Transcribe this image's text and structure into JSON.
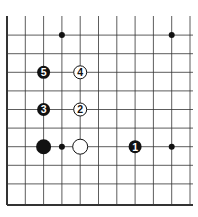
{
  "diagram": {
    "type": "go-board-fragment",
    "columns": 11,
    "rows": 10,
    "edges": [
      "left",
      "bottom"
    ],
    "colors": {
      "black": "#111111",
      "white": "#ffffff",
      "line": "#333333"
    },
    "star_points": [
      {
        "col": 3,
        "row": 1
      },
      {
        "col": 9,
        "row": 1
      },
      {
        "col": 9,
        "row": 7
      }
    ],
    "stones": [
      {
        "color": "black",
        "col": 2,
        "row": 7,
        "label": ""
      },
      {
        "color": "white",
        "col": 4,
        "row": 7,
        "label": ""
      },
      {
        "color": "black",
        "col": 7,
        "row": 7,
        "label": "1"
      },
      {
        "color": "white",
        "col": 4,
        "row": 5,
        "label": "2"
      },
      {
        "color": "black",
        "col": 2,
        "row": 5,
        "label": "3"
      },
      {
        "color": "white",
        "col": 4,
        "row": 3,
        "label": "4"
      },
      {
        "color": "black",
        "col": 2,
        "row": 3,
        "label": "5"
      }
    ],
    "markers": [
      {
        "type": "dot",
        "col": 3,
        "row": 7
      }
    ]
  }
}
